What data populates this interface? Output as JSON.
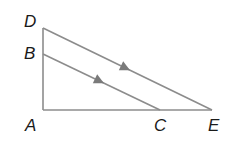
{
  "diagram": {
    "type": "geometry-triangle-parallel-lines",
    "colors": {
      "line": "#8c8c8c",
      "arrow": "#7a7a7a",
      "label": "#1a1a1a",
      "background": "#ffffff"
    },
    "points": {
      "D": {
        "x": 43,
        "y": 28
      },
      "B": {
        "x": 43,
        "y": 54
      },
      "A": {
        "x": 43,
        "y": 110
      },
      "C": {
        "x": 160,
        "y": 110
      },
      "E": {
        "x": 212,
        "y": 110
      }
    },
    "segments": [
      {
        "from": "D",
        "to": "A"
      },
      {
        "from": "A",
        "to": "E"
      },
      {
        "from": "D",
        "to": "E",
        "parallel_mark": true
      },
      {
        "from": "B",
        "to": "C",
        "parallel_mark": true
      }
    ],
    "labels": [
      {
        "text": "D",
        "x": 24,
        "y": 13
      },
      {
        "text": "B",
        "x": 24,
        "y": 45
      },
      {
        "text": "A",
        "x": 25,
        "y": 117
      },
      {
        "text": "C",
        "x": 154,
        "y": 117
      },
      {
        "text": "E",
        "x": 208,
        "y": 117
      }
    ]
  }
}
